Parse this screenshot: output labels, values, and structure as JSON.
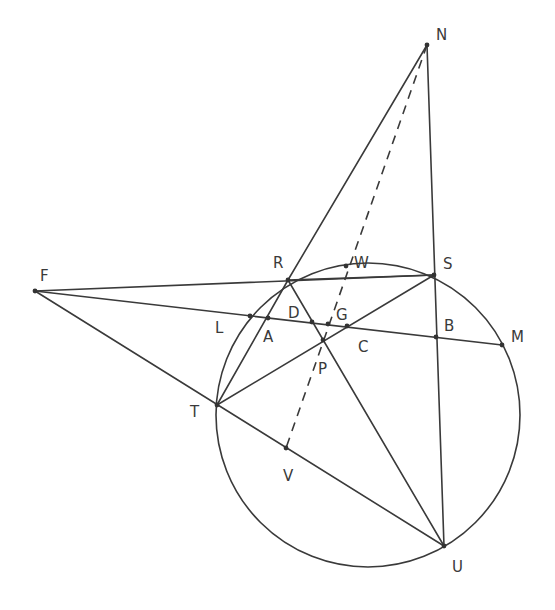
{
  "diagram": {
    "type": "geometry-construction",
    "circle": {
      "cx": 368,
      "cy": 415,
      "r": 152
    },
    "points": {
      "N": {
        "label": "N",
        "x": 427,
        "y": 45,
        "lx": 436,
        "ly": 40
      },
      "R": {
        "label": "R",
        "x": 288,
        "y": 280,
        "lx": 273,
        "ly": 268
      },
      "S": {
        "label": "S",
        "x": 434,
        "y": 275,
        "lx": 443,
        "ly": 269
      },
      "F": {
        "label": "F",
        "x": 35,
        "y": 291,
        "lx": 40,
        "ly": 281
      },
      "L": {
        "label": "L",
        "x": 250,
        "y": 316,
        "lx": 215,
        "ly": 333
      },
      "A": {
        "label": "A",
        "x": 268,
        "y": 318,
        "lx": 263,
        "ly": 342
      },
      "D": {
        "label": "D",
        "x": 312,
        "y": 322,
        "lx": 288,
        "ly": 318
      },
      "G": {
        "label": "G",
        "x": 328,
        "y": 324,
        "lx": 336,
        "ly": 320
      },
      "C": {
        "label": "C",
        "x": 347,
        "y": 326,
        "lx": 358,
        "ly": 352
      },
      "P": {
        "label": "P",
        "x": 323,
        "y": 340,
        "lx": 318,
        "ly": 374
      },
      "B": {
        "label": "B",
        "x": 436,
        "y": 337,
        "lx": 444,
        "ly": 331
      },
      "M": {
        "label": "M",
        "x": 502,
        "y": 345,
        "lx": 511,
        "ly": 342
      },
      "T": {
        "label": "T",
        "x": 217,
        "y": 405,
        "lx": 190,
        "ly": 417
      },
      "V": {
        "label": "V",
        "x": 286,
        "y": 448,
        "lx": 283,
        "ly": 481
      },
      "U": {
        "label": "U",
        "x": 444,
        "y": 546,
        "lx": 452,
        "ly": 572
      },
      "W": {
        "label": "W",
        "x": 346,
        "y": 266,
        "lx": 354,
        "ly": 268
      }
    },
    "segments": [
      {
        "from": "N",
        "to": "R",
        "style": "solid"
      },
      {
        "from": "N",
        "to": "U",
        "style": "solid"
      },
      {
        "from": "F",
        "to": "S",
        "style": "solid"
      },
      {
        "from": "F",
        "to": "M",
        "style": "solid"
      },
      {
        "from": "F",
        "to": "U",
        "style": "solid"
      },
      {
        "from": "R",
        "to": "S",
        "style": "solid"
      },
      {
        "from": "R",
        "to": "T",
        "style": "solid"
      },
      {
        "from": "R",
        "to": "U",
        "style": "solid"
      },
      {
        "from": "T",
        "to": "S",
        "style": "solid"
      },
      {
        "from": "N",
        "to": "V",
        "style": "dashed"
      }
    ],
    "labels": [
      "N",
      "R",
      "S",
      "F",
      "L",
      "A",
      "D",
      "G",
      "C",
      "P",
      "B",
      "M",
      "T",
      "V",
      "U",
      "W"
    ]
  }
}
